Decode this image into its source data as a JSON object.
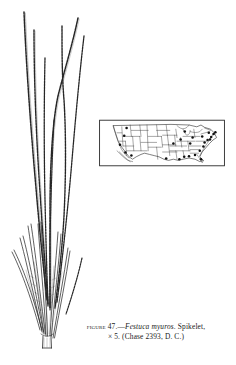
{
  "page": {
    "background_color": "#ffffff",
    "ink_color": "#1a1a1a",
    "width": 236,
    "height": 365
  },
  "figure": {
    "number_label": "Figure 47.",
    "dash": "—",
    "species_name": "Festuca myuros",
    "part_shown": ". Spikelet,",
    "magnification": "× 5.",
    "collection": "(Chase 2393, D. C.)",
    "caption_line_1": "Figure 47.—Festuca myuros. Spikelet,",
    "caption_line_2": "× 5. (Chase 2393, D. C.)"
  },
  "illustration": {
    "name": "spikelet-line-drawing",
    "subject": "Festuca myuros spikelet",
    "description": "Ink line drawing of a grass spikelet with several long slender awns rising from narrow lemmas, converging to a short pedicel at the base",
    "style": "stipple-and-line engraving",
    "stroke_color": "#232323",
    "awn_count": 7,
    "floret_count": 6
  },
  "map": {
    "name": "us-distribution-map",
    "title": "",
    "region": "United States",
    "border_color": "#1a1a1a",
    "dot_color": "#111111",
    "state_line_color": "#444444",
    "dot_legend": "Each dot marks a collection record",
    "dot_count": 26,
    "dots": [
      {
        "state": "Washington",
        "x": 46,
        "y": 14
      },
      {
        "state": "Oregon",
        "x": 42,
        "y": 27
      },
      {
        "state": "California-north",
        "x": 35,
        "y": 42
      },
      {
        "state": "California-south",
        "x": 44,
        "y": 55
      },
      {
        "state": "Arizona",
        "x": 54,
        "y": 60
      },
      {
        "state": "Texas",
        "x": 112,
        "y": 65
      },
      {
        "state": "Louisiana",
        "x": 134,
        "y": 66
      },
      {
        "state": "Mississippi",
        "x": 142,
        "y": 62
      },
      {
        "state": "Alabama",
        "x": 150,
        "y": 61
      },
      {
        "state": "Georgia",
        "x": 160,
        "y": 59
      },
      {
        "state": "Florida",
        "x": 170,
        "y": 66
      },
      {
        "state": "South-Carolina",
        "x": 168,
        "y": 52
      },
      {
        "state": "North-Carolina",
        "x": 174,
        "y": 45
      },
      {
        "state": "Virginia",
        "x": 176,
        "y": 38
      },
      {
        "state": "Maryland",
        "x": 181,
        "y": 34
      },
      {
        "state": "Delaware",
        "x": 185,
        "y": 33
      },
      {
        "state": "New-Jersey",
        "x": 187,
        "y": 29
      },
      {
        "state": "New-York",
        "x": 183,
        "y": 22
      },
      {
        "state": "Connecticut",
        "x": 191,
        "y": 24
      },
      {
        "state": "Massachusetts",
        "x": 194,
        "y": 21
      },
      {
        "state": "Pennsylvania",
        "x": 172,
        "y": 28
      },
      {
        "state": "Ohio",
        "x": 156,
        "y": 30
      },
      {
        "state": "Kentucky",
        "x": 152,
        "y": 40
      },
      {
        "state": "Michigan",
        "x": 143,
        "y": 20
      },
      {
        "state": "Illinois",
        "x": 136,
        "y": 33
      },
      {
        "state": "Missouri",
        "x": 124,
        "y": 40
      }
    ]
  }
}
